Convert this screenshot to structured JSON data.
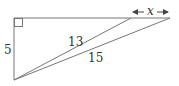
{
  "diagram": {
    "type": "geometry-triangles",
    "stroke_color": "#777777",
    "label_color": "#333333",
    "points": {
      "A": [
        14,
        80
      ],
      "B": [
        14,
        18
      ],
      "C": [
        131,
        18
      ],
      "D": [
        170,
        18
      ]
    },
    "segments": [
      {
        "name": "vertical-leg",
        "from": "A",
        "to": "B",
        "label": "5"
      },
      {
        "name": "top-line",
        "from": "B",
        "to": "D",
        "label": ""
      },
      {
        "name": "hypotenuse-13",
        "from": "A",
        "to": "C",
        "label": "13"
      },
      {
        "name": "hypotenuse-15",
        "from": "A",
        "to": "D",
        "label": "15"
      }
    ],
    "right_angle_at": "B",
    "labels": {
      "vertical": "5",
      "short_hyp": "13",
      "long_hyp": "15",
      "unknown": "x"
    },
    "dimension_arrow": {
      "from_x": 131,
      "to_x": 170,
      "y": 12,
      "label": "x"
    }
  }
}
